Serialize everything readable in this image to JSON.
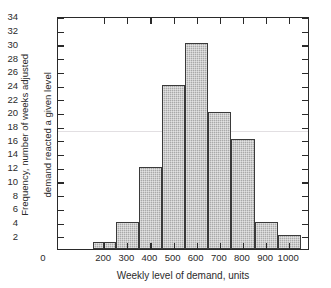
{
  "chart_data": {
    "type": "bar",
    "title": "",
    "subtitle": "",
    "xlabel": "Weekly level of demand, units",
    "ylabel": "Frequency, number of weeks adjusted\ndemand reacted a given level",
    "ylabel_line1": "Frequency, number of weeks adjusted",
    "ylabel_line2": "demand reacted a given level",
    "xlim": [
      0,
      1090
    ],
    "ylim": [
      0,
      34
    ],
    "grid": false,
    "legend": null,
    "x_tick_labels": [
      "0",
      "200",
      "300",
      "400",
      "500",
      "600",
      "700",
      "800",
      "900",
      "1000"
    ],
    "x_tick_values": [
      0,
      200,
      300,
      400,
      500,
      600,
      700,
      800,
      900,
      1000
    ],
    "y_tick_labels": [
      "2",
      "4",
      "6",
      "8",
      "10",
      "12",
      "14",
      "16",
      "18",
      "20",
      "22",
      "24",
      "26",
      "28",
      "30",
      "32",
      "34"
    ],
    "y_tick_values": [
      2,
      4,
      6,
      8,
      10,
      12,
      14,
      16,
      18,
      20,
      22,
      24,
      26,
      28,
      30,
      32,
      34
    ],
    "bin_edges": [
      150,
      250,
      350,
      450,
      550,
      650,
      750,
      850,
      950,
      1050
    ],
    "categories": [
      "150-250",
      "250-350",
      "350-450",
      "450-550",
      "550-650",
      "650-750",
      "750-850",
      "850-950",
      "950-1050"
    ],
    "bar_left_edges": [
      150,
      250,
      350,
      450,
      550,
      650,
      750,
      850,
      950
    ],
    "bar_right_edges": [
      250,
      350,
      450,
      550,
      650,
      750,
      850,
      950,
      1050
    ],
    "values": [
      1,
      4,
      12,
      24,
      30,
      20,
      16,
      4,
      2
    ],
    "split_first_bar_at": 250,
    "bars": [
      {
        "left": 150,
        "right": 250,
        "value": 1,
        "split": true,
        "split_at": 200
      },
      {
        "left": 250,
        "right": 350,
        "value": 4
      },
      {
        "left": 350,
        "right": 450,
        "value": 12
      },
      {
        "left": 450,
        "right": 550,
        "value": 24
      },
      {
        "left": 550,
        "right": 650,
        "value": 30
      },
      {
        "left": 650,
        "right": 750,
        "value": 20
      },
      {
        "left": 750,
        "right": 850,
        "value": 16
      },
      {
        "left": 850,
        "right": 950,
        "value": 4
      },
      {
        "left": 950,
        "right": 1050,
        "value": 2
      }
    ],
    "annotations": [
      {
        "symbol": "X",
        "overbar": true,
        "equals": "=",
        "value": "607",
        "unit": "units/week"
      },
      {
        "symbol": "N",
        "overbar": false,
        "equals": "=",
        "value": "113",
        "unit": ""
      }
    ]
  },
  "annotation": {
    "mean_symbol": "X",
    "mean_text": "= 607 units/week",
    "count_symbol": "N",
    "count_text": "= 113"
  },
  "colors": {
    "bar_fill": "#a9a9a9",
    "bar_stroke": "#3a3a3a",
    "axis": "#2a2a2a",
    "text": "#2b2b2b",
    "background": "#ffffff"
  }
}
